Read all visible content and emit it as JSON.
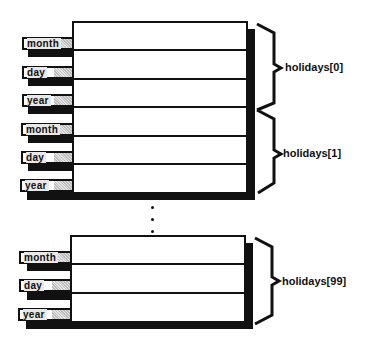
{
  "diagram": {
    "groups": [
      {
        "label": "holidays[0]",
        "fields": [
          {
            "name": "month"
          },
          {
            "name": "day"
          },
          {
            "name": "year"
          }
        ]
      },
      {
        "label": "holidays[1]",
        "fields": [
          {
            "name": "month"
          },
          {
            "name": "day"
          },
          {
            "name": "year"
          }
        ]
      },
      {
        "label": "holidays[99]",
        "fields": [
          {
            "name": "month"
          },
          {
            "name": "day"
          },
          {
            "name": "year"
          }
        ]
      }
    ],
    "ellipsis": "⋮",
    "colors": {
      "line": "#111111",
      "background": "#ffffff",
      "field_fill": "#d9d9d9"
    }
  }
}
